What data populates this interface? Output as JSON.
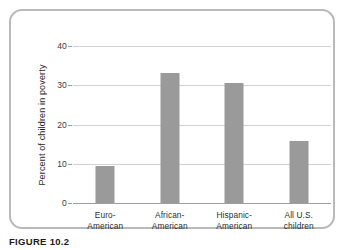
{
  "figure": {
    "caption_label": "FIGURE 10.2",
    "caption_rest": ""
  },
  "chart_data": {
    "type": "bar",
    "title": "",
    "xlabel": "",
    "ylabel": "Percent of children in poverty",
    "categories": [
      "Euro-\nAmerican",
      "African-\nAmerican",
      "Hispanic-\nAmerican",
      "All U.S.\nchildren"
    ],
    "category_lines": [
      [
        "Euro-",
        "American"
      ],
      [
        "African-",
        "American"
      ],
      [
        "Hispanic-",
        "American"
      ],
      [
        "All U.S.",
        "children"
      ]
    ],
    "values": [
      9.4,
      33.0,
      30.5,
      15.7
    ],
    "ylim": [
      0,
      40
    ],
    "yticks": [
      0,
      10,
      20,
      30,
      40
    ],
    "ytick_labels": [
      "0",
      "10",
      "20",
      "30",
      "40"
    ],
    "grid": true,
    "legend": false,
    "bar_color": "#9a9a9a",
    "gridline_color": "#d2d2d2",
    "axis_color": "#9e9e9e"
  }
}
